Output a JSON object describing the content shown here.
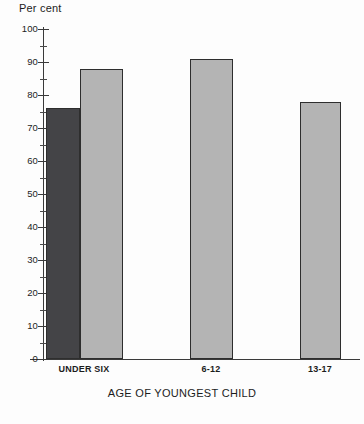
{
  "chart_data": {
    "type": "bar",
    "title": "",
    "xlabel": "AGE OF YOUNGEST CHILD",
    "ylabel": "Per cent",
    "categories": [
      "UNDER SIX",
      "6-12",
      "13-17"
    ],
    "ylim": [
      0,
      100
    ],
    "ytick_step": 10,
    "minor_ticks": true,
    "grid": false,
    "legend": "none",
    "ytick_labels": [
      "0",
      "10",
      "20",
      "30",
      "40",
      "50",
      "60",
      "70",
      "80",
      "90",
      "100"
    ],
    "bars": [
      {
        "category": "UNDER SIX",
        "series": "dark",
        "value": 76,
        "color": "#444447"
      },
      {
        "category": "UNDER SIX",
        "series": "light",
        "value": 88,
        "color": "#b4b4b4"
      },
      {
        "category": "6-12",
        "series": "light",
        "value": 91,
        "color": "#b4b4b4"
      },
      {
        "category": "13-17",
        "series": "light",
        "value": 78,
        "color": "#b4b4b4"
      }
    ],
    "series": [
      {
        "name": "dark",
        "color": "#444447",
        "values": [
          76,
          null,
          null
        ]
      },
      {
        "name": "light",
        "color": "#b4b4b4",
        "values": [
          88,
          91,
          78
        ]
      }
    ]
  },
  "axis": {
    "y_title": "Per cent",
    "x_title": "AGE OF YOUNGEST CHILD",
    "ticks": [
      {
        "label": "100",
        "value": 100
      },
      {
        "label": "90",
        "value": 90
      },
      {
        "label": "80",
        "value": 80
      },
      {
        "label": "70",
        "value": 70
      },
      {
        "label": "60",
        "value": 60
      },
      {
        "label": "50",
        "value": 50
      },
      {
        "label": "40",
        "value": 40
      },
      {
        "label": "30",
        "value": 30
      },
      {
        "label": "20",
        "value": 20
      },
      {
        "label": "10",
        "value": 10
      },
      {
        "label": "0",
        "value": 0
      }
    ]
  },
  "categories": [
    {
      "label": "UNDER SIX",
      "center_x": 84
    },
    {
      "label": "6-12",
      "center_x": 211
    },
    {
      "label": "13-17",
      "center_x": 320
    }
  ]
}
